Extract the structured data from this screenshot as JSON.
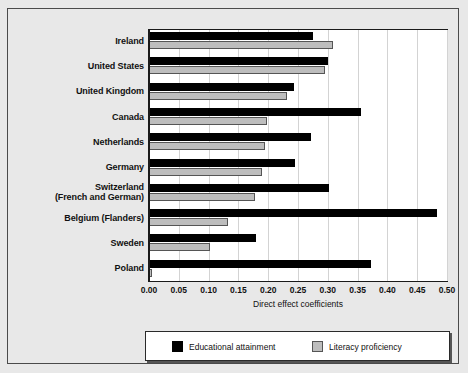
{
  "chart_data": {
    "type": "bar",
    "orientation": "horizontal",
    "title": "",
    "xlabel": "Direct effect coefficients",
    "ylabel": "",
    "xlim": [
      0.0,
      0.5
    ],
    "xticks": [
      "0.00",
      "0.05",
      "0.10",
      "0.15",
      "0.20",
      "0.25",
      "0.30",
      "0.35",
      "0.40",
      "0.45",
      "0.50"
    ],
    "grid": true,
    "legend_position": "bottom",
    "categories": [
      "Ireland",
      "United States",
      "United Kingdom",
      "Canada",
      "Netherlands",
      "Germany",
      "Switzerland (French and German)",
      "Belgium (Flanders)",
      "Sweden",
      "Poland"
    ],
    "category_lines": [
      [
        "Ireland"
      ],
      [
        "United States"
      ],
      [
        "United Kingdom"
      ],
      [
        "Canada"
      ],
      [
        "Netherlands"
      ],
      [
        "Germany"
      ],
      [
        "Switzerland",
        "(French and German)"
      ],
      [
        "Belgium (Flanders)"
      ],
      [
        "Sweden"
      ],
      [
        "Poland"
      ]
    ],
    "series": [
      {
        "name": "Educational attainment",
        "color": "#000000",
        "values": [
          0.275,
          0.301,
          0.243,
          0.355,
          0.272,
          0.245,
          0.302,
          0.483,
          0.18,
          0.372
        ]
      },
      {
        "name": "Literacy proficiency",
        "color": "#bdbdbd",
        "values": [
          0.308,
          0.295,
          0.231,
          0.198,
          0.194,
          0.19,
          0.178,
          0.132,
          0.103,
          0.005
        ]
      }
    ]
  },
  "legend": {
    "items": [
      {
        "label": "Educational attainment",
        "swatch": "black"
      },
      {
        "label": "Literacy proficiency",
        "swatch": "gray"
      }
    ]
  },
  "colors": {
    "background": "#e8e8e8",
    "plot_background": "#ffffff",
    "axis": "#1a1a1a",
    "grid": "#d3d3d3",
    "series_black": "#000000",
    "series_gray": "#bdbdbd"
  }
}
